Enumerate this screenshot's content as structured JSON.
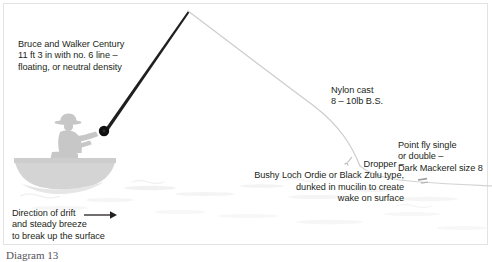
{
  "figure": {
    "caption": "Diagram 13",
    "frame_color": "#e3e3e3",
    "background_color": "#ffffff"
  },
  "colors": {
    "text": "#231f20",
    "rod": "#1a1a1a",
    "reel": "#111111",
    "line": "#cfcfcf",
    "angler": "#c9c9c9",
    "boat": "#d2d2d2",
    "water": "#ececec",
    "caption": "#55525a"
  },
  "labels": {
    "rod": {
      "name": "rod-label",
      "lines": [
        "Bruce and Walker Century",
        "11 ft 3 in with no. 6 line –",
        "floating, or neutral density"
      ],
      "text": "Bruce and Walker Century\n11 ft 3 in with no. 6 line –\nfloating, or neutral density"
    },
    "nylon_cast": {
      "name": "nylon-cast-label",
      "lines": [
        "Nylon cast",
        "8 – 10lb B.S."
      ],
      "text": "Nylon cast\n8 – 10lb B.S."
    },
    "point_fly": {
      "name": "point-fly-label",
      "lines": [
        "Point fly single",
        "or double –",
        "Dark Mackerel size 8"
      ],
      "text": "Point fly single\nor double –\nDark Mackerel size 8"
    },
    "dropper": {
      "name": "dropper-label",
      "lines": [
        "Dropper –",
        "Bushy Loch Ordie or Black Zulu type,",
        "dunked in mucilin to create",
        "wake on surface"
      ],
      "text": "Dropper –\nBushy Loch Ordie or Black Zulu type,\ndunked in mucilin to create\nwake on surface"
    },
    "drift": {
      "name": "drift-label",
      "lines": [
        "Direction of drift",
        "and steady breeze",
        "to break up the surface"
      ],
      "text": "Direction of drift\nand steady breeze\nto break up the surface"
    }
  },
  "icons": {
    "drift_arrow": "arrow-right-icon",
    "reel": "reel-icon",
    "dropper_fly": "dropper-fly-icon",
    "point_fly": "point-fly-icon"
  },
  "scene": {
    "rod": {
      "butt_x": 104,
      "butt_y": 131,
      "tip_x": 188,
      "tip_y": 11
    },
    "fly_line": "from rod tip 188,11 curving right and down to 492,185",
    "boat_center_x": 62,
    "water_line_y": 183
  }
}
